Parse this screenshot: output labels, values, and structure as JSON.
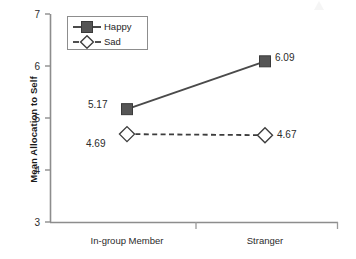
{
  "chart_data": {
    "type": "line",
    "title": "",
    "xlabel": "",
    "ylabel": "Mean Allocation to Self",
    "categories": [
      "In-group Member",
      "Stranger"
    ],
    "ylim": [
      3,
      7
    ],
    "yticks": [
      3,
      4,
      5,
      6,
      7
    ],
    "ytick_labels": [
      "3",
      "4",
      "5",
      "6",
      "7"
    ],
    "grid": false,
    "legend_position": "top-left-inside",
    "series": [
      {
        "name": "Happy",
        "values": [
          5.17,
          6.09
        ],
        "value_labels": [
          "5.17",
          "6.09"
        ],
        "marker": "filled-square",
        "line_style": "solid",
        "color": "#555555"
      },
      {
        "name": "Sad",
        "values": [
          4.69,
          4.67
        ],
        "value_labels": [
          "4.69",
          "4.67"
        ],
        "marker": "open-diamond",
        "line_style": "dashed",
        "color": "#3d3d3d"
      }
    ]
  },
  "axes": {
    "y_title": "Mean Allocation to Self",
    "y_tick_labels": [
      "7",
      "6",
      "5",
      "4",
      "3"
    ],
    "x_tick_labels": [
      "In-group Member",
      "Stranger"
    ]
  },
  "legend": {
    "entries": [
      {
        "label": "Happy",
        "marker": "filled-square",
        "line_style": "solid"
      },
      {
        "label": "Sad",
        "marker": "open-diamond",
        "line_style": "dashed"
      }
    ]
  },
  "point_labels": {
    "happy_ingroup": "5.17",
    "happy_stranger": "6.09",
    "sad_ingroup": "4.69",
    "sad_stranger": "4.67"
  },
  "colors": {
    "axis": "#8d8d8d",
    "happy_marker": "#555555",
    "sad_marker_fill": "#ffffff",
    "sad_marker_stroke": "#3d3d3d",
    "text": "#2b2b2b",
    "background": "#ffffff"
  }
}
